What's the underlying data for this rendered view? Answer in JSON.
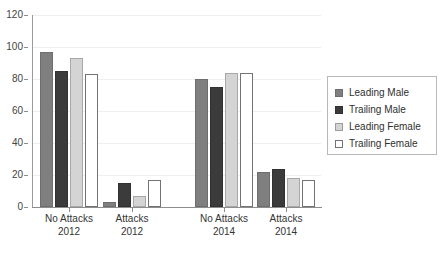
{
  "chart_data": {
    "type": "bar",
    "title": "",
    "xlabel": "",
    "ylabel": "",
    "ylim": [
      0,
      120
    ],
    "ytick_values": [
      0,
      20,
      40,
      60,
      80,
      100,
      120
    ],
    "ytick_labels": [
      "0",
      "20",
      "40",
      "60",
      "80",
      "100",
      "120"
    ],
    "grid": true,
    "legend_position": "right",
    "categories": [
      "No Attacks 2012",
      "Attacks 2012",
      "No Attacks 2014",
      "Attacks 2014"
    ],
    "category_lines": [
      {
        "line1": "No Attacks",
        "line2": "2012"
      },
      {
        "line1": "Attacks",
        "line2": "2012"
      },
      {
        "line1": "No Attacks",
        "line2": "2014"
      },
      {
        "line1": "Attacks",
        "line2": "2014"
      }
    ],
    "series": [
      {
        "name": "Leading Male",
        "color": "#7f7f7f",
        "values": [
          97,
          3,
          80,
          22
        ]
      },
      {
        "name": "Trailing Male",
        "color": "#3b3b3b",
        "values": [
          85,
          15,
          75,
          24
        ]
      },
      {
        "name": "Leading Female",
        "color": "#d4d4d4",
        "values": [
          93,
          7,
          84,
          18
        ]
      },
      {
        "name": "Trailing Female",
        "color": "#ffffff",
        "values": [
          83,
          17,
          84,
          17
        ]
      }
    ]
  },
  "legend": {
    "items": [
      {
        "label": "Leading Male"
      },
      {
        "label": "Trailing Male"
      },
      {
        "label": "Leading Female"
      },
      {
        "label": "Trailing Female"
      }
    ]
  }
}
